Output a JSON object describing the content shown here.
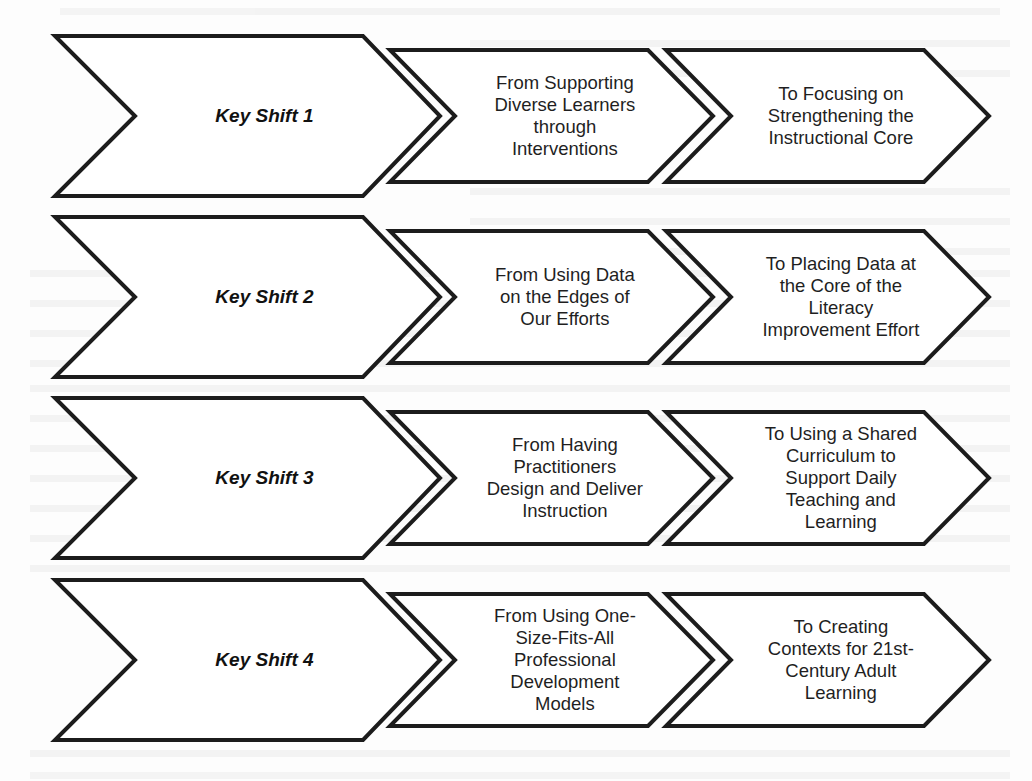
{
  "diagram": {
    "rows": [
      {
        "key": "Key Shift 1",
        "from": [
          "From Supporting",
          "Diverse Learners",
          "through",
          "Interventions"
        ],
        "to": [
          "To Focusing on",
          "Strengthening the",
          "Instructional Core"
        ]
      },
      {
        "key": "Key Shift 2",
        "from": [
          "From Using Data",
          "on the Edges of",
          "Our Efforts"
        ],
        "to": [
          "To Placing Data at",
          "the Core of the",
          "Literacy",
          "Improvement Effort"
        ]
      },
      {
        "key": "Key Shift 3",
        "from": [
          "From Having",
          "Practitioners",
          "Design and Deliver",
          "Instruction"
        ],
        "to": [
          "To Using a Shared",
          "Curriculum to",
          "Support Daily",
          "Teaching and",
          "Learning"
        ]
      },
      {
        "key": "Key Shift 4",
        "from": [
          "From Using One-",
          "Size-Fits-All",
          "Professional",
          "Development",
          "Models"
        ],
        "to": [
          "To Creating",
          "Contexts for 21st-",
          "Century Adult",
          "Learning"
        ]
      }
    ]
  },
  "layout": {
    "row_centers": [
      116,
      297,
      478,
      660
    ],
    "key_half_height": 80,
    "step_half_height": 66
  },
  "colors": {
    "stroke": "#1c1c1c",
    "fill": "#ffffff",
    "background": "#fdfdfd"
  }
}
